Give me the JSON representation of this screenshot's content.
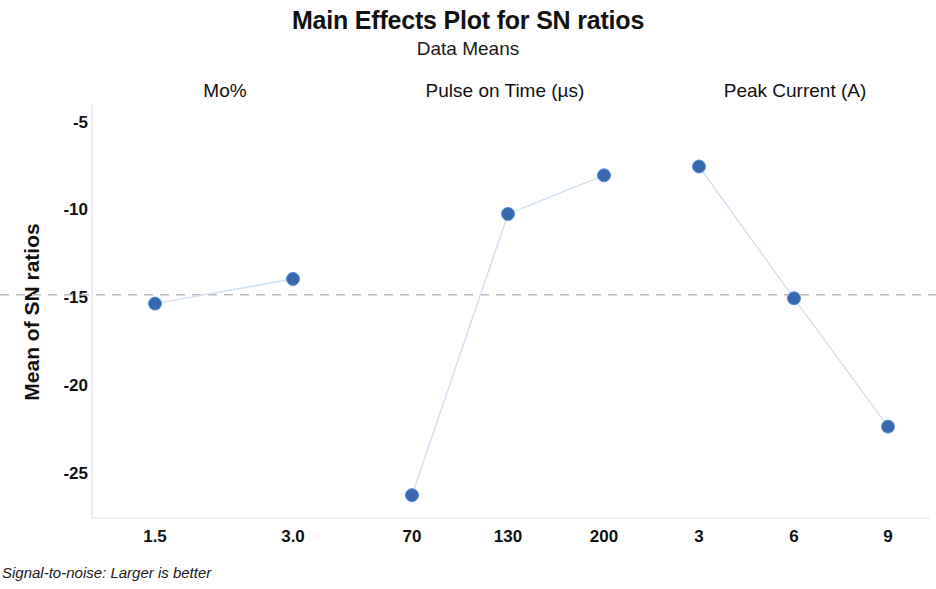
{
  "chart_data": {
    "type": "line",
    "title": "Main Effects Plot for SN ratios",
    "subtitle": "Data Means",
    "ylabel": "Mean of SN ratios",
    "xlabel": "",
    "footnote": "Signal-to-noise: Larger is better",
    "ylim": [
      -27.5,
      -4.0
    ],
    "yticks": [
      -5,
      -10,
      -15,
      -20,
      -25
    ],
    "ytick_labels": [
      "-5",
      "-10",
      "-15",
      "-20",
      "-25"
    ],
    "grid": false,
    "legend": "none",
    "reference_line": {
      "value": -14.8,
      "style": "dashed",
      "color": "#b9b9b9",
      "label": "grand mean"
    },
    "marker_color": "#3568ad",
    "line_color": "#cfe0f2",
    "panels": [
      {
        "name": "Mo%",
        "label": "Mo%",
        "categories": [
          "1.5",
          "3.0"
        ],
        "values": [
          -15.3,
          -13.9
        ]
      },
      {
        "name": "Pulse on Time",
        "label": "Pulse on Time (µs)",
        "categories": [
          "70",
          "130",
          "200"
        ],
        "values": [
          -26.2,
          -10.2,
          -8.0
        ]
      },
      {
        "name": "Peak Current",
        "label": "Peak Current (A)",
        "categories": [
          "3",
          "6",
          "9"
        ],
        "values": [
          -7.5,
          -15.0,
          -22.3
        ]
      }
    ]
  }
}
